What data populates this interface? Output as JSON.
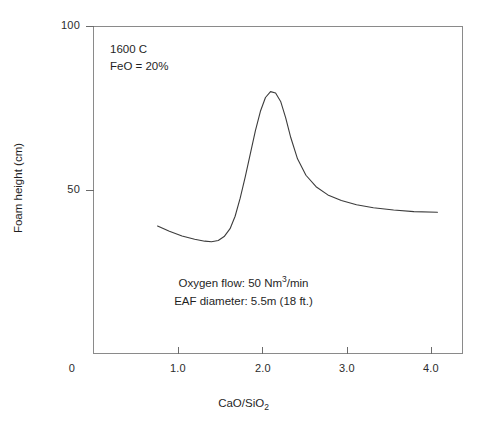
{
  "chart_data": {
    "type": "line",
    "title": "",
    "xlabel": "CaO/SiO2",
    "ylabel": "Foam height (cm)",
    "xlim": [
      0,
      4.4
    ],
    "ylim": [
      0,
      100
    ],
    "grid": false,
    "legend": "none",
    "x_ticks": [
      {
        "value": 0,
        "label": "0"
      },
      {
        "value": 1.0,
        "label": "1.0"
      },
      {
        "value": 2.0,
        "label": "2.0"
      },
      {
        "value": 3.0,
        "label": "3.0"
      },
      {
        "value": 4.0,
        "label": "4.0"
      }
    ],
    "y_ticks": [
      {
        "value": 50,
        "label": "50"
      },
      {
        "value": 100,
        "label": "100"
      }
    ],
    "series": [
      {
        "name": "Foam height vs basicity",
        "x": [
          0.76,
          0.9,
          1.05,
          1.2,
          1.32,
          1.4,
          1.48,
          1.55,
          1.62,
          1.68,
          1.74,
          1.8,
          1.86,
          1.92,
          1.98,
          2.04,
          2.1,
          2.16,
          2.22,
          2.28,
          2.34,
          2.42,
          2.52,
          2.64,
          2.78,
          2.94,
          3.12,
          3.32,
          3.56,
          3.8,
          4.08
        ],
        "y": [
          39.0,
          37.4,
          36.0,
          35.0,
          34.4,
          34.2,
          34.6,
          35.8,
          38.2,
          42.0,
          47.5,
          54.0,
          61.0,
          68.0,
          74.0,
          78.2,
          80.0,
          79.6,
          77.0,
          72.0,
          66.0,
          59.5,
          54.5,
          51.0,
          48.5,
          46.8,
          45.5,
          44.6,
          43.9,
          43.4,
          43.2
        ],
        "color": "#3c3c3c",
        "linewidth": 1.1
      }
    ],
    "annotations": [
      {
        "name": "conditions",
        "lines": [
          "1600 C",
          "FeO = 20%"
        ],
        "position": "upper-left-inside"
      },
      {
        "name": "process-parameters",
        "lines": [
          "Oxygen flow: 50 Nm3/min",
          "EAF diameter: 5.5m (18 ft.)"
        ],
        "position": "lower-center-inside"
      }
    ],
    "peak": {
      "x": 2.1,
      "y": 80
    },
    "minimum": {
      "x": 1.4,
      "y": 34.2
    }
  },
  "axes": {
    "y_title": "Foam height (cm)",
    "x_title_prefix": "CaO/SiO",
    "x_title_subscript": "2",
    "x_tick_labels": [
      "0",
      "1.0",
      "2.0",
      "3.0",
      "4.0"
    ],
    "y_tick_labels": [
      "100",
      "50"
    ]
  },
  "annotations": {
    "temperature": "1600 C",
    "feo": "FeO = 20%",
    "oxygen_prefix": "Oxygen flow: 50 Nm",
    "oxygen_superscript": "3",
    "oxygen_suffix": "/min",
    "eaf_diameter": "EAF diameter: 5.5m (18 ft.)"
  },
  "colors": {
    "curve": "#3c3c3c",
    "frame": "#8a8a8a",
    "text": "#1f1f1f",
    "background": "#ffffff"
  }
}
